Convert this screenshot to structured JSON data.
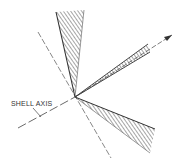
{
  "diagram": {
    "title": "",
    "labels": {
      "shell_axis": "SHELL AXIS"
    },
    "colors": {
      "ink": "#3a3a3a",
      "background": "#ffffff"
    },
    "origin": [
      75,
      97
    ],
    "wedges": [
      {
        "name": "upper-wedge",
        "points": [
          [
            75,
            97
          ],
          [
            56,
            12
          ],
          [
            84,
            10
          ]
        ]
      },
      {
        "name": "right-wedge",
        "points": [
          [
            75,
            97
          ],
          [
            148,
            44
          ],
          [
            150,
            52
          ]
        ]
      },
      {
        "name": "lower-wedge",
        "points": [
          [
            75,
            97
          ],
          [
            155,
            129
          ],
          [
            150,
            153
          ]
        ]
      }
    ],
    "axes": {
      "dashed_line": {
        "from": [
          38,
          32
        ],
        "to": [
          111,
          158
        ]
      },
      "shell_axis_line": {
        "from": [
          18,
          128
        ],
        "to": [
          75,
          97
        ]
      },
      "arrow": {
        "from": [
          75,
          97
        ],
        "to": [
          172,
          35
        ]
      }
    }
  }
}
